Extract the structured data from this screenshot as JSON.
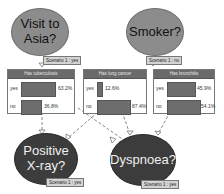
{
  "nodes": {
    "visit_asia": {
      "label_line1": "Visit to",
      "label_line2": "Asia?",
      "scenario": "Scenario 1 : yes"
    },
    "smoker": {
      "label": "Smoker?",
      "scenario": "Scenario 1 : no"
    },
    "xray": {
      "label_line1": "Positive",
      "label_line2": "X-ray?",
      "scenario": "Scenario 1 : yes"
    },
    "dyspnoea": {
      "label": "Dyspnoea?",
      "scenario": "Scenario 1 : yes"
    }
  },
  "monitors": [
    {
      "title": "Has tuberculosis",
      "rows": [
        {
          "state": "yes",
          "value": "63.2%",
          "pct": 63.2
        },
        {
          "state": "no",
          "value": "36.8%",
          "pct": 36.8
        }
      ]
    },
    {
      "title": "Has lung cancer",
      "rows": [
        {
          "state": "yes",
          "value": "12.6%",
          "pct": 12.6
        },
        {
          "state": "no",
          "value": "87.4%",
          "pct": 87.4
        }
      ]
    },
    {
      "title": "Has bronchitis",
      "rows": [
        {
          "state": "yes",
          "value": "45.9%",
          "pct": 45.9
        },
        {
          "state": "no",
          "value": "54.1%",
          "pct": 54.1
        }
      ]
    }
  ],
  "colors": {
    "parent_node": "#8c8c8c",
    "child_node": "#3c3c3c",
    "bar": "#6d6d6d",
    "monitor_header": "#6a6a6a"
  }
}
